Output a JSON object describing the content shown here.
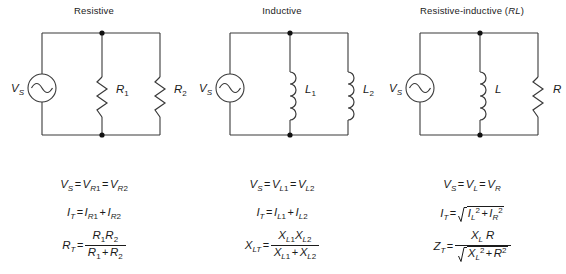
{
  "figure": {
    "type": "circuit-diagram-set",
    "line_color": "#3a3a3a",
    "text_color": "#1b1b1b",
    "background": "#ffffff",
    "columns": 3
  },
  "columns": [
    {
      "id": "resistive",
      "title": "Resistive",
      "title_italic_suffix": "",
      "source_label": "V",
      "source_sub": "S",
      "source_icon": "ac-source-icon",
      "branch1": {
        "component": "resistor-icon",
        "label": "R",
        "sub": "1"
      },
      "branch2": {
        "component": "resistor-icon",
        "label": "R",
        "sub": "2"
      },
      "formulas": {
        "line1": "V_S = V_R1 = V_R2",
        "line2": "I_T = I_R1 + I_R2",
        "line3": "R_T = (R_1 R_2) / (R_1 + R_2)"
      }
    },
    {
      "id": "inductive",
      "title": "Inductive",
      "title_italic_suffix": "",
      "source_label": "V",
      "source_sub": "S",
      "source_icon": "ac-source-icon",
      "branch1": {
        "component": "inductor-icon",
        "label": "L",
        "sub": "1"
      },
      "branch2": {
        "component": "inductor-icon",
        "label": "L",
        "sub": "2"
      },
      "formulas": {
        "line1": "V_S = V_L1 = V_L2",
        "line2": "I_T = I_L1 + I_L2",
        "line3": "X_LT = (X_L1 X_L2) / (X_L1 + X_L2)"
      }
    },
    {
      "id": "resistive-inductive",
      "title": "Resistive-inductive (",
      "title_italic_suffix": "RL",
      "title_close": ")",
      "source_label": "V",
      "source_sub": "S",
      "source_icon": "ac-source-icon",
      "branch1": {
        "component": "inductor-icon",
        "label": "L",
        "sub": ""
      },
      "branch2": {
        "component": "resistor-icon",
        "label": "R",
        "sub": ""
      },
      "formulas": {
        "line1": "V_S = V_L = V_R",
        "line2": "I_T = sqrt(I_L^2 + I_R^2)",
        "line3": "Z_T = (X_L R) / sqrt(X_L^2 + R^2)"
      }
    }
  ],
  "symbols": {
    "equals": "=",
    "plus": "+",
    "V": "V",
    "I": "I",
    "R": "R",
    "L": "L",
    "X": "X",
    "Z": "Z",
    "T": "T",
    "S": "S",
    "one": "1",
    "two": "2",
    "sq": "2",
    "paren_open": "(",
    "paren_close": ")"
  }
}
